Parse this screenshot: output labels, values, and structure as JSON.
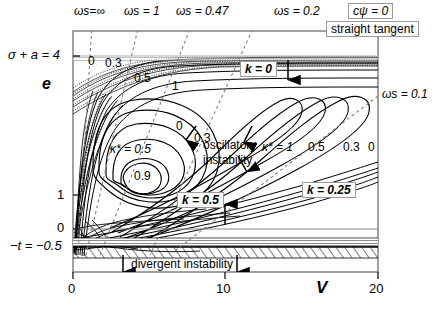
{
  "figure": {
    "background": "#ffffff",
    "frame_color": "#6f6f6f",
    "curve_color": "#000000"
  },
  "axes": {
    "x": {
      "label": "V",
      "ticks": [
        {
          "value": 0,
          "label": "0",
          "px": 73
        },
        {
          "value": 10,
          "label": "10",
          "px": 225
        },
        {
          "value": 20,
          "label": "20",
          "px": 378
        }
      ],
      "range": [
        0,
        20
      ]
    },
    "y": {
      "label": "e",
      "ticks": [
        {
          "value": 4,
          "label": "σ + a = 4",
          "px": 56
        },
        {
          "value": 1,
          "label": "1",
          "px": 195
        },
        {
          "value": 0,
          "label": "0",
          "px": 229
        },
        {
          "value": -0.5,
          "label": "−t = −0.5",
          "px": 247
        }
      ],
      "range": [
        -0.5,
        4
      ]
    }
  },
  "top_labels": [
    {
      "name": "omega-s-infinity",
      "text": "ωs=∞",
      "x": 74,
      "y": 6
    },
    {
      "name": "omega-s-1",
      "text": "ωs = 1",
      "x": 124,
      "y": 6
    },
    {
      "name": "omega-s-047",
      "text": "ωs = 0.47",
      "x": 176,
      "y": 6
    },
    {
      "name": "omega-s-02",
      "text": "ωs = 0.2",
      "x": 274,
      "y": 6
    }
  ],
  "right_labels": [
    {
      "name": "omega-s-01",
      "text": "ωs = 0.1",
      "x": 382,
      "y": 95
    }
  ],
  "boxed_labels": [
    {
      "name": "c-psi-zero",
      "text": "cψ = 0",
      "x": 348,
      "y": 4
    },
    {
      "name": "straight-tangent",
      "text": "straight tangent",
      "x": 326,
      "y": 22
    },
    {
      "name": "k-equals-0",
      "text": "k = 0",
      "x": 242,
      "y": 62
    },
    {
      "name": "k-equals-05",
      "text": "k = 0.5",
      "x": 180,
      "y": 195
    },
    {
      "name": "k-equals-025",
      "text": "k = 0.25",
      "x": 304,
      "y": 185
    }
  ],
  "contour_labels": [
    {
      "name": "contour-label-0-topleft",
      "text": "0",
      "x": 88,
      "y": 61
    },
    {
      "name": "contour-label-03-topleft",
      "text": "0.3",
      "x": 107,
      "y": 62
    },
    {
      "name": "contour-label-05-top",
      "text": "0.5",
      "x": 137,
      "y": 76
    },
    {
      "name": "contour-label-1-top",
      "text": "1",
      "x": 174,
      "y": 84
    },
    {
      "name": "contour-label-0-center",
      "text": "0",
      "x": 176,
      "y": 125
    },
    {
      "name": "contour-label-03-center",
      "text": "0.3",
      "x": 196,
      "y": 136
    },
    {
      "name": "contour-label-kappa-05",
      "text": "κ* = 0.5",
      "x": 113,
      "y": 148
    },
    {
      "name": "contour-label-09",
      "text": "0.9",
      "x": 136,
      "y": 175
    },
    {
      "name": "contour-label-kappa-1",
      "text": "κ* = 1",
      "x": 264,
      "y": 146
    },
    {
      "name": "contour-label-05-right",
      "text": "0.5",
      "x": 309,
      "y": 146
    },
    {
      "name": "contour-label-03-right",
      "text": "0.3",
      "x": 344,
      "y": 146
    },
    {
      "name": "contour-label-0-right",
      "text": "0",
      "x": 369,
      "y": 146
    }
  ],
  "annotations": [
    {
      "name": "oscillatory-instability",
      "line1": "oscillatory",
      "line2": "instability",
      "x": 204,
      "y": 142
    },
    {
      "name": "divergent-instability",
      "text": "divergent instability",
      "x": 132,
      "y": 265
    }
  ],
  "legend_symbols": {
    "kappa_star": "κ*",
    "omega_s": "ωs",
    "k": "k"
  }
}
